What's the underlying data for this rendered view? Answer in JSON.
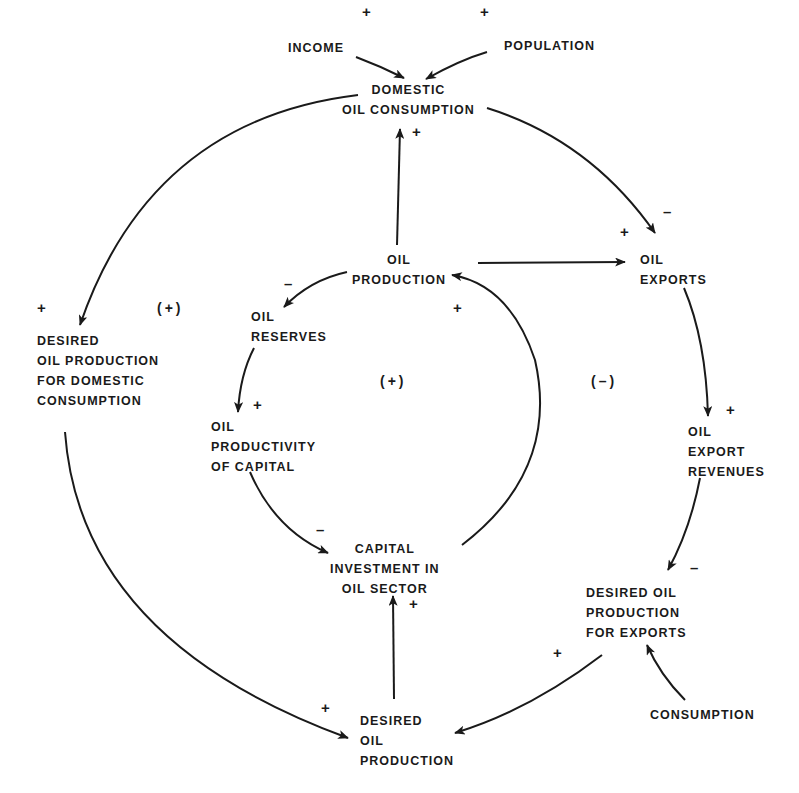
{
  "diagram": {
    "type": "causal-loop-diagram",
    "nodes": {
      "income": "INCOME",
      "population": "POPULATION",
      "domestic_oil_consumption": "DOMESTIC\nOIL CONSUMPTION",
      "oil_production": "OIL\nPRODUCTION",
      "oil_exports": "OIL\nEXPORTS",
      "oil_reserves": "OIL\nRESERVES",
      "desired_oil_production_domestic": "DESIRED\nOIL PRODUCTION\nFOR DOMESTIC\nCONSUMPTION",
      "oil_productivity_of_capital": "OIL\nPRODUCTIVITY\nOF CAPITAL",
      "oil_export_revenues": "OIL\nEXPORT\nREVENUES",
      "capital_investment": "CAPITAL\nINVESTMENT IN\nOIL SECTOR",
      "desired_oil_production_exports": "DESIRED OIL\nPRODUCTION\nFOR EXPORTS",
      "consumption": "CONSUMPTION",
      "desired_oil_production": "DESIRED\nOIL\nPRODUCTION"
    },
    "edges": [
      {
        "from": "INCOME",
        "to": "DOMESTIC OIL CONSUMPTION",
        "polarity": "+"
      },
      {
        "from": "POPULATION",
        "to": "DOMESTIC OIL CONSUMPTION",
        "polarity": "+"
      },
      {
        "from": "OIL PRODUCTION",
        "to": "DOMESTIC OIL CONSUMPTION",
        "polarity": "+"
      },
      {
        "from": "DOMESTIC OIL CONSUMPTION",
        "to": "OIL EXPORTS",
        "polarity": "-"
      },
      {
        "from": "OIL PRODUCTION",
        "to": "OIL EXPORTS",
        "polarity": "+"
      },
      {
        "from": "DOMESTIC OIL CONSUMPTION",
        "to": "DESIRED OIL PRODUCTION FOR DOMESTIC CONSUMPTION",
        "polarity": "+"
      },
      {
        "from": "OIL PRODUCTION",
        "to": "OIL RESERVES",
        "polarity": "-"
      },
      {
        "from": "OIL RESERVES",
        "to": "OIL PRODUCTIVITY OF CAPITAL",
        "polarity": "+"
      },
      {
        "from": "OIL PRODUCTIVITY OF CAPITAL",
        "to": "CAPITAL INVESTMENT IN OIL SECTOR",
        "polarity": "-"
      },
      {
        "from": "CAPITAL INVESTMENT IN OIL SECTOR",
        "to": "OIL PRODUCTION",
        "polarity": "+"
      },
      {
        "from": "OIL EXPORTS",
        "to": "OIL EXPORT REVENUES",
        "polarity": "+"
      },
      {
        "from": "OIL EXPORT REVENUES",
        "to": "DESIRED OIL PRODUCTION FOR EXPORTS",
        "polarity": "-"
      },
      {
        "from": "CONSUMPTION",
        "to": "DESIRED OIL PRODUCTION FOR EXPORTS",
        "polarity": ""
      },
      {
        "from": "DESIRED OIL PRODUCTION FOR EXPORTS",
        "to": "DESIRED OIL PRODUCTION",
        "polarity": "+"
      },
      {
        "from": "DESIRED OIL PRODUCTION FOR DOMESTIC CONSUMPTION",
        "to": "DESIRED OIL PRODUCTION",
        "polarity": "+"
      },
      {
        "from": "DESIRED OIL PRODUCTION",
        "to": "CAPITAL INVESTMENT IN OIL SECTOR",
        "polarity": "+"
      }
    ],
    "signs": {
      "income": "+",
      "population": "+",
      "prod_to_domestic": "+",
      "domestic_to_exports": "–",
      "prod_to_exports": "+",
      "domestic_to_desired_dom": "+",
      "prod_to_reserves": "–",
      "reserves_to_productivity": "+",
      "productivity_to_capital": "–",
      "capital_to_prod": "+",
      "exports_to_revenues": "+",
      "revenues_to_desired_exp": "–",
      "desired_exp_to_desired": "+",
      "desired_dom_to_desired": "+",
      "desired_to_capital": "+"
    },
    "loops": {
      "left": "(+)",
      "center": "(+)",
      "right": "(–)"
    },
    "colors": {
      "ink": "#1a1a1a",
      "background": "#ffffff"
    }
  }
}
